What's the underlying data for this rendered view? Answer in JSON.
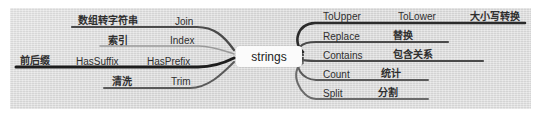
{
  "diagram": {
    "type": "mind-map",
    "center": {
      "label": "strings"
    },
    "canvas_color": "#dcdcdc",
    "page_background": "#ffffff"
  },
  "left_branches": [
    {
      "id": "join",
      "cn_label": "数组转字符串",
      "en_label": "Join",
      "line_color": "#4a4a4a",
      "line_width": 2.2
    },
    {
      "id": "index",
      "cn_label": "索引",
      "en_label": "Index",
      "line_color": "#9a9a9a",
      "line_width": 1.6
    },
    {
      "id": "hasprefix",
      "cn_label": "前后缀",
      "en_label": "HasSuffix",
      "en_label2": "HasPrefix",
      "line_color": "#1d1d1d",
      "line_width": 3.0
    },
    {
      "id": "trim",
      "cn_label": "清洗",
      "en_label": "Trim",
      "line_color": "#5a5a5a",
      "line_width": 2.0
    }
  ],
  "right_branches": [
    {
      "id": "toupper",
      "en_label": "ToUpper",
      "en_label2": "ToLower",
      "cn_label": "大小写转换",
      "line_color": "#2b2b2b",
      "line_width": 2.6
    },
    {
      "id": "replace",
      "en_label": "Replace",
      "cn_label": "替换",
      "line_color": "#4a4a4a",
      "line_width": 2.2
    },
    {
      "id": "contains",
      "en_label": "Contains",
      "cn_label": "包含关系",
      "line_color": "#4a4a4a",
      "line_width": 2.2
    },
    {
      "id": "count",
      "en_label": "Count",
      "cn_label": "统计",
      "line_color": "#5a5a5a",
      "line_width": 2.0
    },
    {
      "id": "split",
      "en_label": "Split",
      "cn_label": "分割",
      "line_color": "#6a6a6a",
      "line_width": 2.0
    }
  ]
}
